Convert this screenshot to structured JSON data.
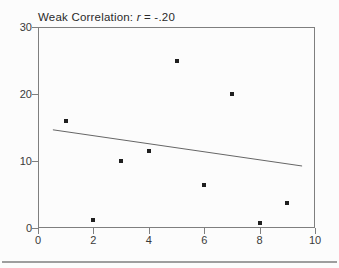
{
  "figure": {
    "title_prefix": "Weak Correlation: ",
    "title_stat_symbol": "r",
    "title_suffix": " = -.20"
  },
  "chart_data": {
    "type": "scatter",
    "title": "Weak Correlation: r = -.20",
    "points": [
      [
        1,
        16
      ],
      [
        2,
        1.2
      ],
      [
        3,
        10
      ],
      [
        4,
        11.5
      ],
      [
        5,
        25
      ],
      [
        6,
        6.4
      ],
      [
        7,
        20
      ],
      [
        8,
        0.8
      ],
      [
        9,
        3.8
      ]
    ],
    "trend_line": {
      "x1": 0.5,
      "y1": 14.8,
      "x2": 9.5,
      "y2": 9.4
    },
    "xlim": [
      0,
      10
    ],
    "ylim": [
      0,
      30
    ],
    "x_ticks": [
      0,
      2,
      4,
      6,
      8,
      10
    ],
    "y_ticks": [
      0,
      10,
      20,
      30
    ],
    "xlabel": "",
    "ylabel": "",
    "grid": false,
    "legend": "none",
    "marker": "filled-square",
    "colors": {
      "marker": "#1f1f1f",
      "trend_line": "#666666",
      "frame": "#7f7f7f",
      "tick_label": "#3a3a3a",
      "title": "#2a2a2a",
      "divider": "#9e9e9e",
      "background": "#fcfcfc"
    }
  }
}
